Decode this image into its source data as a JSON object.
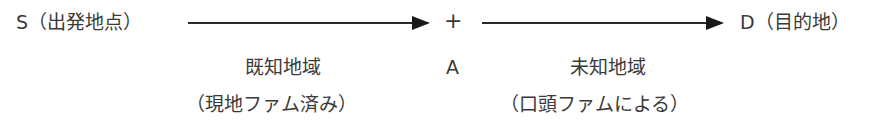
{
  "diagram": {
    "start": {
      "label": "S（出発地点）"
    },
    "midpoint": {
      "symbol": "+",
      "label": "A"
    },
    "end": {
      "label": "D（目的地）"
    },
    "segments": [
      {
        "region": "既知地域",
        "note": "（現地ファム済み）"
      },
      {
        "region": "未知地域",
        "note": "（口頭ファムによる）"
      }
    ]
  }
}
